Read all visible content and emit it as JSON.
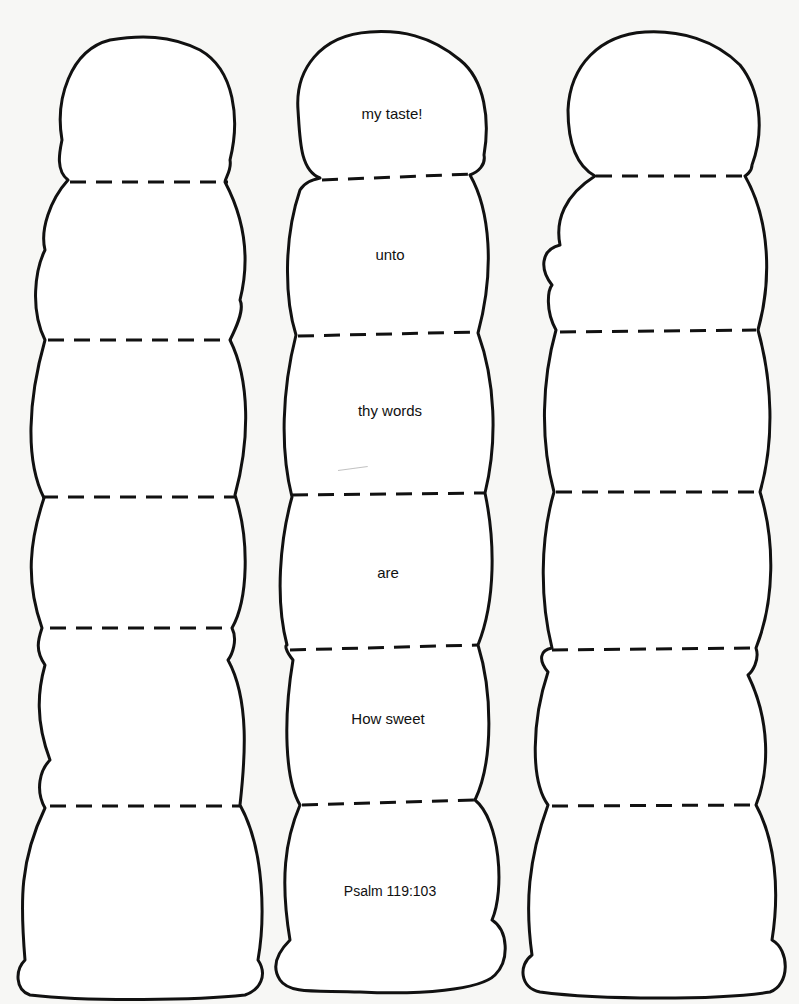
{
  "worksheet": {
    "columns": [
      {
        "id": "left",
        "scoops": [
          "",
          "",
          "",
          "",
          "",
          ""
        ]
      },
      {
        "id": "middle",
        "scoops": [
          "my taste!",
          "unto",
          "thy words",
          "are",
          "How sweet",
          "Psalm 119:103"
        ]
      },
      {
        "id": "right",
        "scoops": [
          "",
          "",
          "",
          "",
          "",
          ""
        ]
      }
    ],
    "colors": {
      "ink": "#111111",
      "paper": "#ffffff"
    }
  }
}
